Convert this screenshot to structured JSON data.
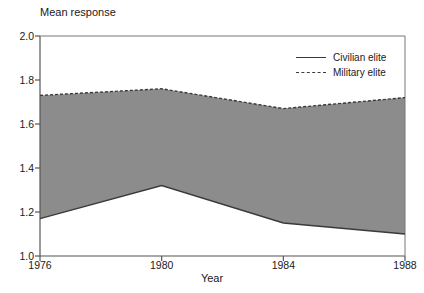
{
  "chart_data": {
    "type": "area",
    "title": "",
    "ylabel": "Mean response",
    "xlabel": "Year",
    "x": [
      1976,
      1980,
      1984,
      1988
    ],
    "xticklabels": [
      "1976",
      "1980",
      "1984",
      "1988"
    ],
    "yticks": [
      1.0,
      1.2,
      1.4,
      1.6,
      1.8,
      2.0
    ],
    "yticklabels": [
      "1.0",
      "1.2",
      "1.4",
      "1.6",
      "1.8",
      "2.0"
    ],
    "ylim": [
      1.0,
      2.0
    ],
    "xlim": [
      1976,
      1988
    ],
    "grid": false,
    "legend_position": "top-right",
    "fill_color": "#8c8c8c",
    "line_color": "#3a3a3a",
    "series": [
      {
        "name": "Military elite",
        "style": "dashed",
        "values": [
          1.73,
          1.76,
          1.67,
          1.72
        ]
      },
      {
        "name": "Civilian elite",
        "style": "solid",
        "values": [
          1.17,
          1.32,
          1.15,
          1.1
        ]
      }
    ]
  },
  "legend": {
    "items": [
      {
        "label": "Civilian elite",
        "style": "solid"
      },
      {
        "label": "Military elite",
        "style": "dashed"
      }
    ]
  }
}
